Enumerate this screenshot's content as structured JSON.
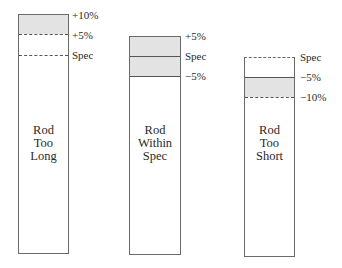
{
  "diagram": {
    "rods": [
      {
        "caption": [
          "Rod",
          "Too",
          "Long"
        ],
        "marks": [
          "+10%",
          "+5%",
          "Spec"
        ]
      },
      {
        "caption": [
          "Rod",
          "Within",
          "Spec"
        ],
        "marks": [
          "+5%",
          "Spec",
          "−5%"
        ]
      },
      {
        "caption": [
          "Rod",
          "Too",
          "Short"
        ],
        "marks": [
          "Spec",
          "−5%",
          "−10%"
        ]
      }
    ],
    "colors": {
      "tolerance_band": "#e3e3e3",
      "outline": "#6a6a6a"
    }
  }
}
